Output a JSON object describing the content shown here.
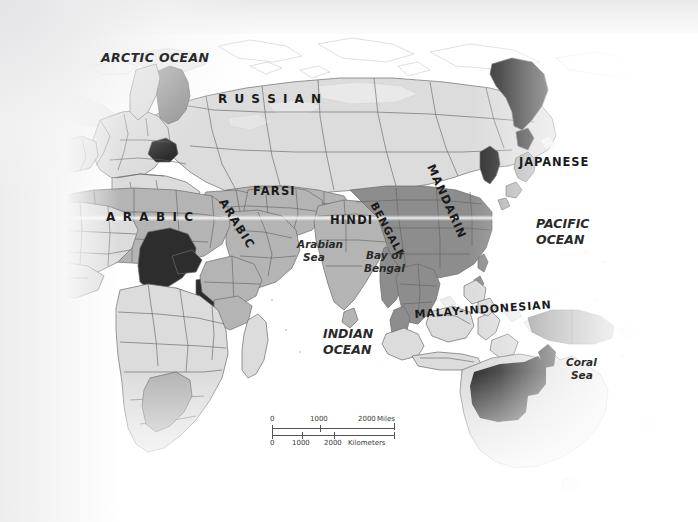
{
  "map": {
    "title": "World Language Distribution Map",
    "labels": {
      "oceans": [
        {
          "name": "ARCTIC OCEAN",
          "text": "ARCTIC OCEAN"
        },
        {
          "name": "PACIFIC OCEAN",
          "text_line1": "PACIFIC",
          "text_line2": "OCEAN"
        },
        {
          "name": "INDIAN OCEAN",
          "text_line1": "INDIAN",
          "text_line2": "OCEAN"
        }
      ],
      "seas": [
        {
          "name": "Arabian Sea",
          "text_line1": "Arabian",
          "text_line2": "Sea"
        },
        {
          "name": "Bay of Bengal",
          "text_line1": "Bay of",
          "text_line2": "Bengal"
        },
        {
          "name": "Coral Sea",
          "text_line1": "Coral",
          "text_line2": "Sea"
        }
      ],
      "languages": [
        {
          "id": "russian",
          "text": "R U S S I A N"
        },
        {
          "id": "farsi",
          "text": "FARSI"
        },
        {
          "id": "arabic_africa",
          "text": "A R A B I C"
        },
        {
          "id": "arabic_arabia",
          "text": "ARABIC"
        },
        {
          "id": "hindi",
          "text": "HINDI"
        },
        {
          "id": "bengali",
          "text": "BENGALI"
        },
        {
          "id": "mandarin",
          "text": "MANDARIN"
        },
        {
          "id": "japanese",
          "text": "JAPANESE"
        },
        {
          "id": "malay_indonesian",
          "text": "MALAY-INDONESIAN"
        }
      ]
    },
    "scale": {
      "miles": {
        "unit_label": "Miles",
        "ticks": [
          "0",
          "1000",
          "2000"
        ]
      },
      "kilometers": {
        "unit_label": "Kilometers",
        "ticks": [
          "0",
          "1000",
          "2000"
        ]
      }
    },
    "colors": {
      "land_light": "#dcdcdc",
      "land_mid": "#b4b4b4",
      "land_dark": "#8d8d8d",
      "land_black": "#2d2d2d",
      "ocean": "#fafafa",
      "border": "#5a5a5a",
      "coast": "#6b6b6b",
      "label_text": "#1a1a1a"
    }
  }
}
